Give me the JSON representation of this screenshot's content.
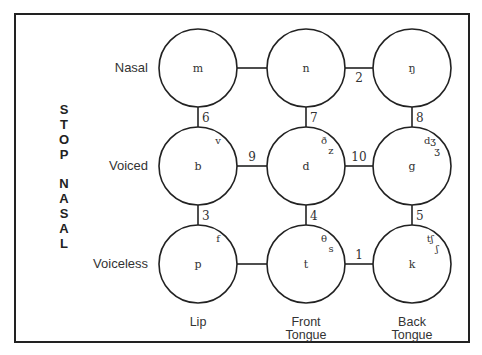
{
  "diagram": {
    "side_label": {
      "word1": [
        "S",
        "T",
        "O",
        "P"
      ],
      "word2": [
        "N",
        "A",
        "S",
        "A",
        "L"
      ]
    },
    "rows": [
      {
        "label": "Nasal",
        "y": 68
      },
      {
        "label": "Voiced",
        "y": 166
      },
      {
        "label": "Voiceless",
        "y": 264
      }
    ],
    "columns": [
      {
        "label_line1": "Lip",
        "label_line2": "",
        "x": 198
      },
      {
        "label_line1": "Front",
        "label_line2": "Tongue",
        "x": 306
      },
      {
        "label_line1": "Back",
        "label_line2": "Tongue",
        "x": 412
      }
    ],
    "nodes": [
      {
        "id": "m",
        "row": 0,
        "col": 0,
        "symbol": "m",
        "extras": []
      },
      {
        "id": "n",
        "row": 0,
        "col": 1,
        "symbol": "n",
        "extras": []
      },
      {
        "id": "ng",
        "row": 0,
        "col": 2,
        "symbol": "ŋ",
        "extras": []
      },
      {
        "id": "b",
        "row": 1,
        "col": 0,
        "symbol": "b",
        "extras": [
          "v"
        ]
      },
      {
        "id": "d",
        "row": 1,
        "col": 1,
        "symbol": "d",
        "extras": [
          "ð",
          "z"
        ]
      },
      {
        "id": "g",
        "row": 1,
        "col": 2,
        "symbol": "g",
        "extras": [
          "dʒ",
          "ʒ"
        ]
      },
      {
        "id": "p",
        "row": 2,
        "col": 0,
        "symbol": "p",
        "extras": [
          "f"
        ]
      },
      {
        "id": "t",
        "row": 2,
        "col": 1,
        "symbol": "t",
        "extras": [
          "θ",
          "s"
        ]
      },
      {
        "id": "k",
        "row": 2,
        "col": 2,
        "symbol": "k",
        "extras": [
          "tʃ",
          "ʃ"
        ]
      }
    ],
    "edges": [
      {
        "from": "m",
        "to": "n",
        "label": ""
      },
      {
        "from": "n",
        "to": "ng",
        "label": "2"
      },
      {
        "from": "m",
        "to": "b",
        "label": "6"
      },
      {
        "from": "n",
        "to": "d",
        "label": "7"
      },
      {
        "from": "ng",
        "to": "g",
        "label": "8"
      },
      {
        "from": "b",
        "to": "d",
        "label": "9"
      },
      {
        "from": "d",
        "to": "g",
        "label": "10"
      },
      {
        "from": "b",
        "to": "p",
        "label": "3"
      },
      {
        "from": "d",
        "to": "t",
        "label": "4"
      },
      {
        "from": "g",
        "to": "k",
        "label": "5"
      },
      {
        "from": "p",
        "to": "t",
        "label": ""
      },
      {
        "from": "t",
        "to": "k",
        "label": "1"
      }
    ],
    "radius": 39,
    "stroke_color": "#222222"
  }
}
